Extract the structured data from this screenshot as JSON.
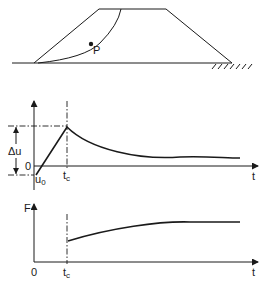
{
  "embankment": {
    "point_label": "P"
  },
  "pore_pressure_plot": {
    "y_delta_label": "Δu",
    "origin_label": "0",
    "initial_label": "u",
    "initial_sub": "0",
    "tc_label": "t",
    "tc_sub": "c",
    "x_label": "t"
  },
  "safety_factor_plot": {
    "y_label": "F",
    "origin_label": "0",
    "tc_label": "t",
    "tc_sub": "c",
    "x_label": "t"
  },
  "colors": {
    "ink": "#1a1a1a",
    "background": "#ffffff"
  }
}
